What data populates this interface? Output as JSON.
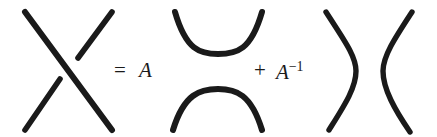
{
  "figure": {
    "name": "kauffman-bracket-skein-relation",
    "background_color": "#ffffff",
    "ink_color": "#1a1a1a",
    "stroke_width": 6,
    "width": 437,
    "height": 137
  },
  "equation": {
    "equals_symbol": "=",
    "plus_symbol": "+",
    "coefficient_first": "A",
    "coefficient_second_base": "A",
    "coefficient_second_exponent": "−1"
  },
  "diagrams": {
    "crossing": {
      "label": "crossing-tangle",
      "description": "X crossing with over-strand from top-left to bottom-right",
      "over_strand": {
        "from": [
          25,
          12
        ],
        "to": [
          112,
          130
        ]
      },
      "under_strand_upper": {
        "from": [
          112,
          12
        ],
        "to": [
          78,
          58
        ]
      },
      "under_strand_lower": {
        "from": [
          60,
          78
        ],
        "to": [
          25,
          130
        ]
      }
    },
    "horizontal_smoothing": {
      "label": "horizontal-smoothing-tangle",
      "description": "Two arcs opening vertically: upper arc curves down, lower arc curves up",
      "upper_arc": {
        "from": [
          175,
          12
        ],
        "control": [
          218,
          72
        ],
        "to": [
          262,
          12
        ]
      },
      "lower_arc": {
        "from": [
          173,
          130
        ],
        "control": [
          218,
          70
        ],
        "to": [
          262,
          130
        ]
      }
    },
    "vertical_smoothing": {
      "label": "vertical-smoothing-tangle",
      "description": "Two arcs opening horizontally: left arc bulges right, right arc bulges left",
      "left_arc": {
        "from": [
          326,
          12
        ],
        "control": [
          372,
          71
        ],
        "to": [
          329,
          130
        ]
      },
      "right_arc": {
        "from": [
          412,
          12
        ],
        "control": [
          366,
          71
        ],
        "to": [
          410,
          132
        ]
      }
    }
  }
}
